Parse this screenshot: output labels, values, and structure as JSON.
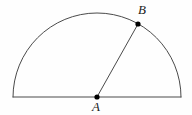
{
  "figure": {
    "kind": "geometry-diagram",
    "width": 192,
    "height": 115,
    "background_color": "#fefefe",
    "stroke_color": "#4a4a4a",
    "point_color": "#000000",
    "label_color": "#1a1a1a",
    "stroke_width": 1,
    "semicircle": {
      "center_x": 97,
      "center_y": 97,
      "radius": 84,
      "left_endpoint_x": 13,
      "right_endpoint_x": 181,
      "baseline_y": 97,
      "apex_y": 13,
      "arc_path": "M 13 97 A 84 84 0 0 1 181 97",
      "diameter_path": "M 13 97 L 181 97"
    },
    "points": [
      {
        "id": "A",
        "label": "A",
        "x": 97,
        "y": 97,
        "dot_radius": 2.6,
        "label_x": 92,
        "label_y": 100,
        "role": "center"
      },
      {
        "id": "B",
        "label": "B",
        "x": 138,
        "y": 24,
        "dot_radius": 2.6,
        "label_x": 138,
        "label_y": 3,
        "role": "point-on-arc"
      }
    ],
    "segments": [
      {
        "id": "radius-AB",
        "from": "A",
        "to": "B",
        "x1": 97,
        "y1": 97,
        "x2": 138,
        "y2": 24
      }
    ]
  }
}
